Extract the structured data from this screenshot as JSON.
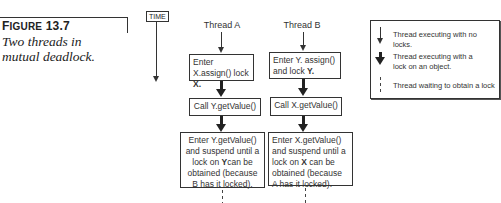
{
  "caption": {
    "figure_label_prefix": "F",
    "figure_label_rest": "IGURE",
    "figure_number": "13.7",
    "description": "Two threads in mutual deadlock."
  },
  "time_axis": {
    "label": "TIME"
  },
  "threads": [
    {
      "name": "Thread A",
      "steps": [
        {
          "text": "Enter X.assign() lock ",
          "bold": "X."
        },
        {
          "text": "Call Y.getValue()"
        },
        {
          "line1": "Enter Y.getValue() and suspend until a lock on ",
          "bold": "Y",
          "line2": "can be obtained (because B has it locked)."
        }
      ]
    },
    {
      "name": "Thread B",
      "steps": [
        {
          "text": "Enter Y. assign() and lock ",
          "bold": "Y."
        },
        {
          "text": "Call X.getValue()"
        },
        {
          "line1": "Enter X.getValue() and suspend until a lock on ",
          "bold": "X",
          "line2": " can be obtained (because A has it locked)."
        }
      ]
    }
  ],
  "legend": {
    "items": [
      {
        "icon": "thin-arrow",
        "text": "Thread executing with no locks."
      },
      {
        "icon": "thick-arrow",
        "text": "Thread executing with a lock on an object."
      },
      {
        "icon": "dashed-line",
        "text": "Thread waiting to obtain a lock"
      }
    ]
  }
}
